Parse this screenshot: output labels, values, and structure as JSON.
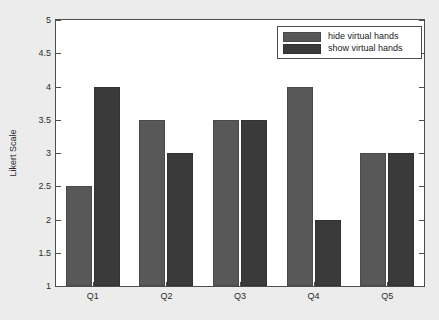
{
  "chart_data": {
    "type": "bar",
    "title": "",
    "xlabel": "",
    "ylabel": "Likert Scale",
    "categories": [
      "Q1",
      "Q2",
      "Q3",
      "Q4",
      "Q5"
    ],
    "series": [
      {
        "name": "hide virtual hands",
        "color": "#585858",
        "values": [
          2.5,
          3.5,
          3.5,
          4.0,
          3.0
        ]
      },
      {
        "name": "show virtual hands",
        "color": "#3a3a3a",
        "values": [
          4.0,
          3.0,
          3.5,
          2.0,
          3.0
        ]
      }
    ],
    "ylim": [
      1,
      5
    ],
    "ytick_labels": [
      "1",
      "1.5",
      "2",
      "2.5",
      "3",
      "3.5",
      "4",
      "4.5",
      "5"
    ],
    "ytick_values": [
      1,
      1.5,
      2,
      2.5,
      3,
      3.5,
      4,
      4.5,
      5
    ],
    "grid": false,
    "legend_position": "top-right",
    "background_color": "#ececec",
    "plot_background_color": "#ffffff",
    "axis_color": "#4d4d4d"
  }
}
